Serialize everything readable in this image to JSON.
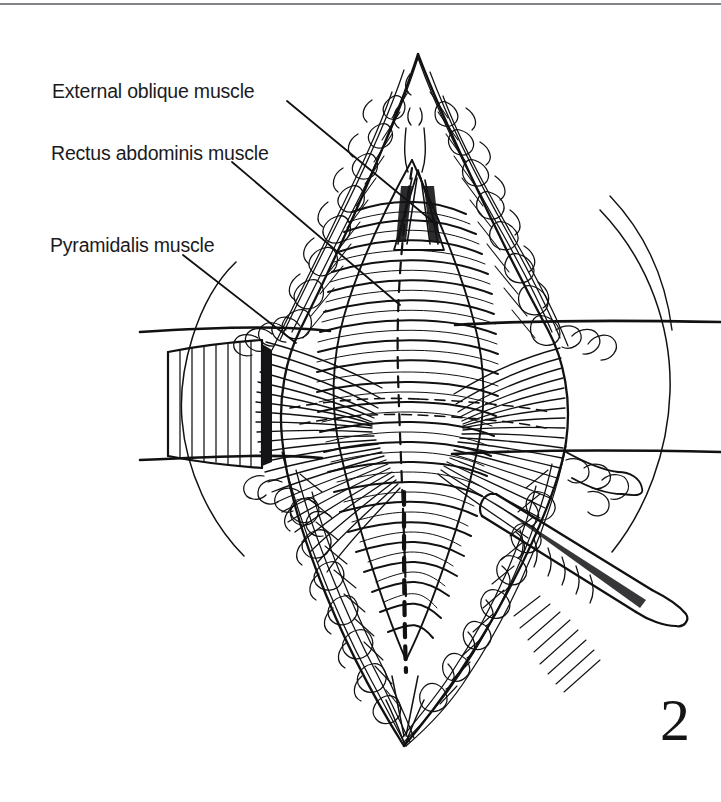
{
  "figure": {
    "number": "2",
    "type": "line-drawing",
    "background_color": "#ffffff",
    "ink_color": "#111113"
  },
  "labels": [
    {
      "id": "external-oblique",
      "text": "External oblique muscle",
      "x": 52,
      "y": 80,
      "leader": {
        "x1": 287,
        "y1": 101,
        "x2": 437,
        "y2": 225
      }
    },
    {
      "id": "rectus-abdominis",
      "text": "Rectus abdominis muscle",
      "x": 51,
      "y": 142,
      "leader": {
        "x1": 232,
        "y1": 162,
        "x2": 400,
        "y2": 305
      }
    },
    {
      "id": "pyramidalis",
      "text": "Pyramidalis muscle",
      "x": 50,
      "y": 234,
      "leader": {
        "x1": 183,
        "y1": 255,
        "x2": 296,
        "y2": 343
      }
    }
  ],
  "anatomy": {
    "structures": [
      "external oblique muscle",
      "rectus abdominis muscle",
      "pyramidalis muscle",
      "subcutaneous fat",
      "skin edge",
      "linea alba (dashed midline)"
    ],
    "instruments": [
      "self-retaining retractor blade (left)",
      "retractor blade (right)",
      "forceps / scalpel handle (lower right)"
    ],
    "drape_lines": [
      {
        "x1": 140,
        "y1": 332,
        "x2": 721,
        "y2": 322
      },
      {
        "x1": 140,
        "y1": 460,
        "x2": 721,
        "y2": 452
      }
    ]
  }
}
